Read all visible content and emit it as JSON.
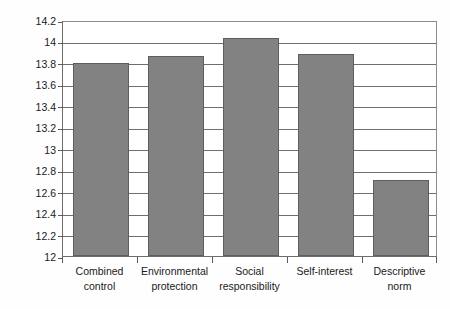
{
  "chart_data": {
    "type": "bar",
    "title": "",
    "xlabel": "",
    "ylabel": "Average kilowatt hours per day",
    "categories": [
      "Combined control",
      "Environmental protection",
      "Social responsibility",
      "Self-interest",
      "Descriptive norm"
    ],
    "category_lines": [
      [
        "Combined",
        "control"
      ],
      [
        "Environmental",
        "protection"
      ],
      [
        "Social",
        "responsibility"
      ],
      [
        "Self-interest",
        ""
      ],
      [
        "Descriptive",
        "norm"
      ]
    ],
    "values": [
      13.8,
      13.86,
      14.03,
      13.88,
      12.71
    ],
    "ylim": [
      12,
      14.2
    ],
    "ytick_step": 0.2,
    "yticks": [
      12,
      12.2,
      12.4,
      12.6,
      12.8,
      13,
      13.2,
      13.4,
      13.6,
      13.8,
      14,
      14.2
    ],
    "ytick_labels": [
      "12",
      "12.2",
      "12.4",
      "12.6",
      "12.8",
      "13",
      "13.2",
      "13.4",
      "13.6",
      "13.8",
      "14",
      "14.2"
    ],
    "grid": true,
    "legend": false,
    "bar_color": "#828282",
    "bar_edge_color": "#5e5e5e",
    "axis_color": "#6f6f6f",
    "background_color": "#fefefe"
  }
}
